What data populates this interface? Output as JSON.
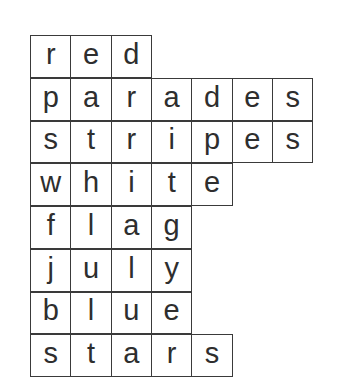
{
  "words": [
    {
      "word": "red",
      "letters": [
        "r",
        "e",
        "d"
      ]
    },
    {
      "word": "parades",
      "letters": [
        "p",
        "a",
        "r",
        "a",
        "d",
        "e",
        "s"
      ]
    },
    {
      "word": "stripes",
      "letters": [
        "s",
        "t",
        "r",
        "i",
        "p",
        "e",
        "s"
      ]
    },
    {
      "word": "white",
      "letters": [
        "w",
        "h",
        "i",
        "t",
        "e"
      ]
    },
    {
      "word": "flag",
      "letters": [
        "f",
        "l",
        "a",
        "g"
      ]
    },
    {
      "word": "july",
      "letters": [
        "j",
        "u",
        "l",
        "y"
      ]
    },
    {
      "word": "blue",
      "letters": [
        "b",
        "l",
        "u",
        "e"
      ]
    },
    {
      "word": "stars",
      "letters": [
        "s",
        "t",
        "a",
        "r",
        "s"
      ]
    }
  ]
}
